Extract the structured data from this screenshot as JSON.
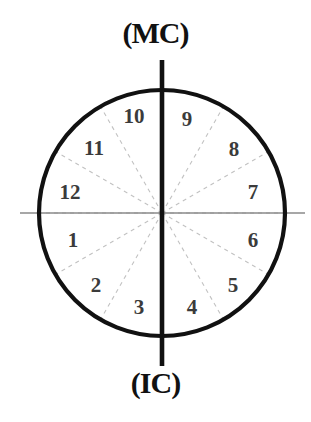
{
  "diagram": {
    "title_top": "(MC)",
    "title_bottom": "(IC)",
    "geometry": {
      "center_x": 162,
      "center_y": 213,
      "radius": 123,
      "label_radius": 93,
      "vertical_axis_top_y": 60,
      "vertical_axis_bottom_y": 366,
      "horizontal_axis_left_x": 20,
      "horizontal_axis_right_x": 305
    },
    "colors": {
      "circle_stroke": "#111111",
      "main_axis_stroke": "#111111",
      "horizontal_axis_stroke": "#8a8a8a",
      "cusp_dashed_stroke": "#c2c2c2",
      "number_text": "#3b3b3b",
      "label_text": "#111111",
      "background": "#ffffff"
    },
    "houses": [
      {
        "label": "1",
        "angle_deg": 195,
        "x": 73,
        "y": 240
      },
      {
        "label": "2",
        "angle_deg": 225,
        "x": 96,
        "y": 285
      },
      {
        "label": "3",
        "angle_deg": 255,
        "x": 139,
        "y": 307
      },
      {
        "label": "4",
        "angle_deg": 285,
        "x": 192,
        "y": 307
      },
      {
        "label": "5",
        "angle_deg": 315,
        "x": 233,
        "y": 285
      },
      {
        "label": "6",
        "angle_deg": 345,
        "x": 253,
        "y": 240
      },
      {
        "label": "7",
        "angle_deg": 15,
        "x": 253,
        "y": 192
      },
      {
        "label": "8",
        "angle_deg": 45,
        "x": 234,
        "y": 149
      },
      {
        "label": "9",
        "angle_deg": 75,
        "x": 187,
        "y": 119
      },
      {
        "label": "10",
        "angle_deg": 105,
        "x": 134,
        "y": 116
      },
      {
        "label": "11",
        "angle_deg": 135,
        "x": 94,
        "y": 148
      },
      {
        "label": "12",
        "angle_deg": 165,
        "x": 70,
        "y": 192
      }
    ],
    "cusp_lines": [
      {
        "name": "cusp-1-12",
        "angle_deg": 180
      },
      {
        "name": "cusp-2-1",
        "angle_deg": 210
      },
      {
        "name": "cusp-3-2",
        "angle_deg": 240
      },
      {
        "name": "cusp-5-4",
        "angle_deg": 300
      },
      {
        "name": "cusp-6-5",
        "angle_deg": 330
      },
      {
        "name": "cusp-7-6",
        "angle_deg": 0
      },
      {
        "name": "cusp-8-7",
        "angle_deg": 30
      },
      {
        "name": "cusp-9-8",
        "angle_deg": 60
      },
      {
        "name": "cusp-11-10",
        "angle_deg": 120
      },
      {
        "name": "cusp-12-11",
        "angle_deg": 150
      }
    ]
  }
}
